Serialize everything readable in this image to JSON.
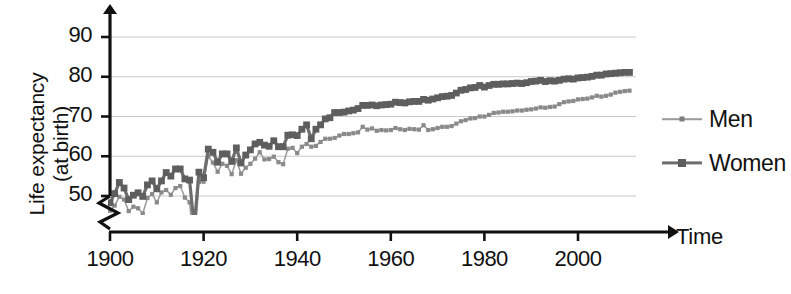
{
  "chart_data": {
    "type": "line",
    "title": "",
    "xlabel": "Time",
    "ylabel_line1": "Life expectancy",
    "ylabel_line2": "(at birth)",
    "xlim": [
      1900,
      2011
    ],
    "ylim": [
      43,
      92
    ],
    "y_axis_break": true,
    "y_break_note": "axis broken below 50",
    "grid": "horizontal",
    "legend_position": "right",
    "y_ticks": [
      50,
      60,
      70,
      80,
      90
    ],
    "x_ticks": [
      1900,
      1920,
      1940,
      1960,
      1980,
      2000
    ],
    "colors": {
      "men_line": "#9a9a9a",
      "women_line": "#6d6d6d",
      "gridline": "#c9c9c9",
      "axis": "#111111",
      "background": "#ffffff"
    },
    "series": [
      {
        "name": "Men",
        "marker": "small-dot",
        "x": [
          1900,
          1901,
          1902,
          1903,
          1904,
          1905,
          1906,
          1907,
          1908,
          1909,
          1910,
          1911,
          1912,
          1913,
          1914,
          1915,
          1916,
          1917,
          1918,
          1919,
          1920,
          1921,
          1922,
          1923,
          1924,
          1925,
          1926,
          1927,
          1928,
          1929,
          1930,
          1931,
          1932,
          1933,
          1934,
          1935,
          1936,
          1937,
          1938,
          1939,
          1940,
          1941,
          1942,
          1943,
          1944,
          1945,
          1946,
          1947,
          1948,
          1949,
          1950,
          1951,
          1952,
          1953,
          1954,
          1955,
          1956,
          1957,
          1958,
          1959,
          1960,
          1961,
          1962,
          1963,
          1964,
          1965,
          1966,
          1967,
          1968,
          1969,
          1970,
          1971,
          1972,
          1973,
          1974,
          1975,
          1976,
          1977,
          1978,
          1979,
          1980,
          1981,
          1982,
          1983,
          1984,
          1985,
          1986,
          1987,
          1988,
          1989,
          1990,
          1991,
          1992,
          1993,
          1994,
          1995,
          1996,
          1997,
          1998,
          1999,
          2000,
          2001,
          2002,
          2003,
          2004,
          2005,
          2006,
          2007,
          2008,
          2009,
          2010,
          2011
        ],
        "values": [
          46.3,
          47.6,
          49.8,
          49.1,
          46.2,
          47.3,
          46.9,
          45.6,
          49.5,
          50.5,
          48.4,
          50.9,
          51.5,
          50.3,
          52.0,
          52.5,
          49.6,
          48.4,
          36.6,
          53.5,
          53.6,
          60.0,
          58.4,
          56.1,
          58.1,
          57.6,
          55.5,
          59.0,
          55.6,
          57.1,
          58.1,
          59.4,
          61.0,
          59.2,
          59.3,
          59.9,
          58.5,
          58.0,
          61.9,
          62.1,
          60.8,
          62.4,
          63.1,
          62.4,
          62.6,
          63.6,
          64.4,
          64.4,
          64.6,
          65.2,
          65.6,
          65.6,
          65.8,
          66.0,
          67.4,
          66.7,
          67.0,
          66.4,
          66.6,
          66.5,
          66.6,
          67.1,
          66.8,
          66.6,
          66.9,
          66.8,
          66.7,
          67.8,
          66.6,
          66.8,
          67.1,
          67.4,
          67.4,
          67.6,
          68.2,
          68.8,
          69.1,
          69.5,
          69.6,
          70.0,
          70.0,
          70.4,
          70.9,
          71.0,
          71.2,
          71.2,
          71.3,
          71.5,
          71.5,
          71.7,
          71.8,
          72.0,
          72.3,
          72.2,
          72.4,
          72.5,
          73.1,
          73.6,
          73.8,
          73.9,
          74.3,
          74.4,
          74.5,
          74.8,
          75.2,
          75.0,
          75.2,
          75.5,
          76.0,
          76.2,
          76.4,
          76.5
        ]
      },
      {
        "name": "Women",
        "marker": "square",
        "x": [
          1900,
          1901,
          1902,
          1903,
          1904,
          1905,
          1906,
          1907,
          1908,
          1909,
          1910,
          1911,
          1912,
          1913,
          1914,
          1915,
          1916,
          1917,
          1918,
          1919,
          1920,
          1921,
          1922,
          1923,
          1924,
          1925,
          1926,
          1927,
          1928,
          1929,
          1930,
          1931,
          1932,
          1933,
          1934,
          1935,
          1936,
          1937,
          1938,
          1939,
          1940,
          1941,
          1942,
          1943,
          1944,
          1945,
          1946,
          1947,
          1948,
          1949,
          1950,
          1951,
          1952,
          1953,
          1954,
          1955,
          1956,
          1957,
          1958,
          1959,
          1960,
          1961,
          1962,
          1963,
          1964,
          1965,
          1966,
          1967,
          1968,
          1969,
          1970,
          1971,
          1972,
          1973,
          1974,
          1975,
          1976,
          1977,
          1978,
          1979,
          1980,
          1981,
          1982,
          1983,
          1984,
          1985,
          1986,
          1987,
          1988,
          1989,
          1990,
          1991,
          1992,
          1993,
          1994,
          1995,
          1996,
          1997,
          1998,
          1999,
          2000,
          2001,
          2002,
          2003,
          2004,
          2005,
          2006,
          2007,
          2008,
          2009,
          2010,
          2011
        ],
        "values": [
          48.3,
          50.6,
          53.4,
          52.0,
          49.1,
          50.2,
          50.8,
          49.9,
          52.8,
          53.8,
          51.8,
          53.8,
          55.9,
          55.0,
          56.8,
          56.8,
          54.3,
          54.0,
          42.2,
          56.0,
          54.6,
          61.8,
          61.0,
          58.5,
          60.6,
          60.6,
          58.7,
          62.1,
          58.3,
          60.3,
          61.6,
          63.1,
          63.5,
          62.8,
          62.5,
          63.9,
          62.4,
          62.4,
          65.3,
          65.4,
          65.2,
          66.8,
          67.9,
          64.4,
          66.8,
          67.9,
          69.4,
          69.7,
          71.0,
          71.0,
          71.1,
          71.4,
          71.6,
          72.0,
          72.8,
          72.8,
          72.9,
          72.7,
          72.9,
          73.0,
          73.1,
          73.6,
          73.5,
          73.4,
          73.7,
          73.8,
          73.8,
          74.3,
          74.1,
          74.4,
          74.7,
          75.0,
          75.1,
          75.3,
          75.9,
          76.6,
          76.8,
          77.2,
          77.3,
          77.8,
          77.4,
          77.8,
          78.1,
          78.1,
          78.2,
          78.2,
          78.3,
          78.4,
          78.3,
          78.5,
          78.8,
          78.9,
          79.1,
          78.8,
          79.0,
          78.9,
          79.1,
          79.4,
          79.5,
          79.4,
          79.7,
          79.8,
          79.9,
          80.1,
          80.4,
          80.4,
          80.7,
          80.8,
          80.9,
          81.0,
          81.1,
          81.1
        ]
      }
    ]
  },
  "axes": {
    "x_axis_label": "Time",
    "y_axis_label_line1": "Life expectancy",
    "y_axis_label_line2": "(at birth)",
    "y_tick_labels": [
      "50",
      "60",
      "70",
      "80",
      "90"
    ],
    "x_tick_labels": [
      "1900",
      "1920",
      "1940",
      "1960",
      "1980",
      "2000"
    ]
  },
  "legend": {
    "items": [
      {
        "label": "Men"
      },
      {
        "label": "Women"
      }
    ]
  }
}
